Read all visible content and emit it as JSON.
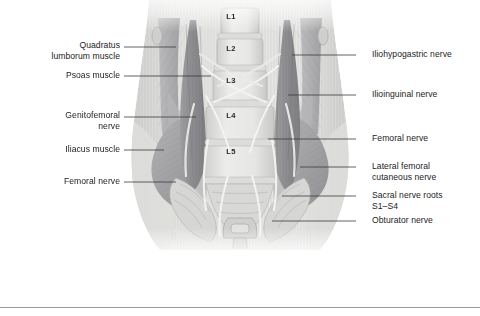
{
  "figure": {
    "orientation": "anterior view of lumbar spine, psoas and iliacus muscles with lumbar plexus nerves"
  },
  "colors": {
    "background": "#ffffff",
    "label_text": "#1c1c1c",
    "leader_line": "#3a3a3a",
    "rule": "#9a9a9a",
    "skin_light": "#e9e9e7",
    "skin_shadow": "#d4d4d2",
    "muscle_mid": "#a9a9ab",
    "muscle_dark": "#8b8b8e",
    "bone_light": "#e4e4e2",
    "bone_shadow": "#c2c2c0",
    "nerve": "#f0f0ee"
  },
  "labels_left": [
    {
      "id": "quadratus-lumborum-muscle",
      "text": "Quadratus\nlumborum muscle",
      "text_right_x": 120,
      "text_top_y": 40,
      "leader": {
        "x1": 124,
        "y1": 47,
        "x2": 176,
        "y2": 47
      }
    },
    {
      "id": "psoas-muscle",
      "text": "Psoas muscle",
      "text_right_x": 120,
      "text_top_y": 70,
      "leader": {
        "x1": 124,
        "y1": 76,
        "x2": 211,
        "y2": 76
      }
    },
    {
      "id": "genitofemoral-nerve",
      "text": "Genitofemoral\nnerve",
      "text_right_x": 120,
      "text_top_y": 110,
      "leader": {
        "x1": 124,
        "y1": 117,
        "x2": 196,
        "y2": 117
      }
    },
    {
      "id": "iliacus-muscle",
      "text": "Iliacus muscle",
      "text_right_x": 120,
      "text_top_y": 144,
      "leader": {
        "x1": 124,
        "y1": 150,
        "x2": 164,
        "y2": 150
      }
    },
    {
      "id": "femoral-nerve-left",
      "text": "Femoral nerve",
      "text_right_x": 120,
      "text_top_y": 176,
      "leader": {
        "x1": 124,
        "y1": 182,
        "x2": 176,
        "y2": 182
      }
    }
  ],
  "labels_right": [
    {
      "id": "iliohypogastric-nerve",
      "text": "Iliohypogastric nerve",
      "text_left_x": 372,
      "text_top_y": 49,
      "leader": {
        "x1": 356,
        "y1": 55,
        "x2": 292,
        "y2": 55
      }
    },
    {
      "id": "ilioinguinal-nerve",
      "text": "Ilioinguinal nerve",
      "text_left_x": 372,
      "text_top_y": 89,
      "leader": {
        "x1": 356,
        "y1": 95,
        "x2": 288,
        "y2": 95
      }
    },
    {
      "id": "femoral-nerve-right",
      "text": "Femoral nerve",
      "text_left_x": 372,
      "text_top_y": 133,
      "leader": {
        "x1": 356,
        "y1": 139,
        "x2": 268,
        "y2": 139
      }
    },
    {
      "id": "lateral-femoral-cutaneous-nerve",
      "text": "Lateral femoral\ncutaneous nerve",
      "text_left_x": 372,
      "text_top_y": 161,
      "leader": {
        "x1": 356,
        "y1": 167,
        "x2": 300,
        "y2": 167
      }
    },
    {
      "id": "sacral-nerve-roots",
      "text": "Sacral nerve roots\nS1–S4",
      "text_left_x": 372,
      "text_top_y": 190,
      "leader": {
        "x1": 356,
        "y1": 196,
        "x2": 282,
        "y2": 196
      }
    },
    {
      "id": "obturator-nerve",
      "text": "Obturator nerve",
      "text_left_x": 372,
      "text_top_y": 215,
      "leader": {
        "x1": 356,
        "y1": 221,
        "x2": 272,
        "y2": 221
      }
    }
  ],
  "vertebrae": [
    {
      "id": "L1",
      "text": "L1",
      "x": 231,
      "y": 12
    },
    {
      "id": "L2",
      "text": "L2",
      "x": 231,
      "y": 44
    },
    {
      "id": "L3",
      "text": "L3",
      "x": 231,
      "y": 76
    },
    {
      "id": "L4",
      "text": "L4",
      "x": 231,
      "y": 111
    },
    {
      "id": "L5",
      "text": "L5",
      "x": 231,
      "y": 147
    }
  ]
}
